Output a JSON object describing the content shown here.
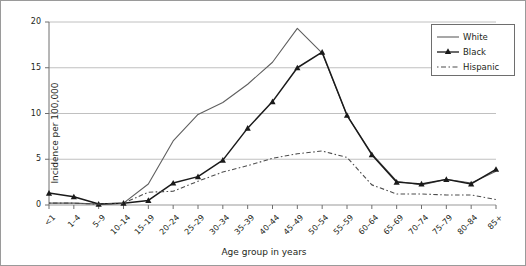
{
  "chart_data": {
    "type": "line",
    "title": "",
    "xlabel": "Age group in years",
    "ylabel": "Incidence per 100,000",
    "categories": [
      "<1",
      "1–4",
      "5–9",
      "10–14",
      "15–19",
      "20–24",
      "25–29",
      "30–34",
      "35–39",
      "40–44",
      "45–49",
      "50–54",
      "55–59",
      "60–64",
      "65–69",
      "70–74",
      "75–79",
      "80–84",
      "85+"
    ],
    "ylim": [
      0,
      20
    ],
    "yticks": [
      0,
      5,
      10,
      15,
      20
    ],
    "ytick_labels": [
      "0",
      "5",
      "10",
      "15",
      "20"
    ],
    "grid": "horizontal",
    "legend_position": "top-right",
    "series": [
      {
        "name": "White",
        "style": "solid",
        "color": "#5f5f5f",
        "marker": "none",
        "values": [
          0.2,
          0.2,
          0.1,
          0.2,
          2.3,
          7.0,
          9.9,
          11.2,
          13.2,
          15.6,
          19.3,
          16.6,
          9.8,
          5.6,
          2.6,
          2.2,
          2.8,
          2.4,
          3.7
        ]
      },
      {
        "name": "Black",
        "style": "solid",
        "color": "#1a1a1a",
        "marker": "triangle",
        "values": [
          1.3,
          0.9,
          0.1,
          0.2,
          0.5,
          2.4,
          3.1,
          4.9,
          8.4,
          11.3,
          15.0,
          16.7,
          9.8,
          5.5,
          2.5,
          2.3,
          2.8,
          2.3,
          3.9
        ]
      },
      {
        "name": "Hispanic",
        "style": "dashed",
        "color": "#4d4d4d",
        "marker": "none",
        "values": [
          0.2,
          0.2,
          0.1,
          0.2,
          1.4,
          1.5,
          2.6,
          3.6,
          4.3,
          5.1,
          5.6,
          5.9,
          5.2,
          2.2,
          1.2,
          1.2,
          1.1,
          1.1,
          0.6
        ]
      }
    ]
  },
  "legend": {
    "items": [
      {
        "label": "White"
      },
      {
        "label": "Black"
      },
      {
        "label": "Hispanic"
      }
    ]
  }
}
